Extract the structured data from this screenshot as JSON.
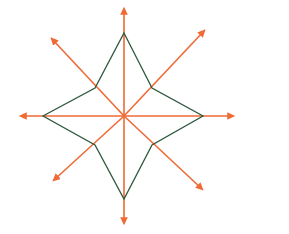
{
  "figure": {
    "center": {
      "x": 124,
      "y": 116
    },
    "axes": {
      "color": "#ef6a35",
      "stroke_width": 1.6,
      "arrow_head_size": 5,
      "rays": [
        {
          "name": "north",
          "label": "N",
          "tip_x": 124,
          "tip_y": 3
        },
        {
          "name": "northeast",
          "label": "NE",
          "tip_x": 209,
          "tip_y": 26
        },
        {
          "name": "east",
          "label": "E",
          "tip_x": 239,
          "tip_y": 116
        },
        {
          "name": "southeast",
          "label": "SE",
          "tip_x": 207,
          "tip_y": 194
        },
        {
          "name": "south",
          "label": "S",
          "tip_x": 124,
          "tip_y": 229
        },
        {
          "name": "southwest",
          "label": "SW",
          "tip_x": 49,
          "tip_y": 185
        },
        {
          "name": "west",
          "label": "W",
          "tip_x": 15,
          "tip_y": 116
        },
        {
          "name": "northwest",
          "label": "NW",
          "tip_x": 47,
          "tip_y": 34
        }
      ]
    },
    "star": {
      "color": "#2f5a3f",
      "stroke_width": 1.3,
      "fill": "none",
      "points": [
        {
          "name": "star-point-north",
          "x": 124,
          "y": 33
        },
        {
          "name": "star-inner-northeast",
          "x": 152,
          "y": 88
        },
        {
          "name": "star-point-east",
          "x": 203,
          "y": 116
        },
        {
          "name": "star-inner-southeast",
          "x": 152,
          "y": 145
        },
        {
          "name": "star-point-south",
          "x": 124,
          "y": 199
        },
        {
          "name": "star-inner-southwest",
          "x": 95,
          "y": 145
        },
        {
          "name": "star-point-west",
          "x": 43,
          "y": 116
        },
        {
          "name": "star-inner-northwest",
          "x": 95,
          "y": 88
        }
      ]
    }
  },
  "credit": {
    "text": "Banco de imagens/Arquivo da editora",
    "color": "#8e8e8e"
  }
}
